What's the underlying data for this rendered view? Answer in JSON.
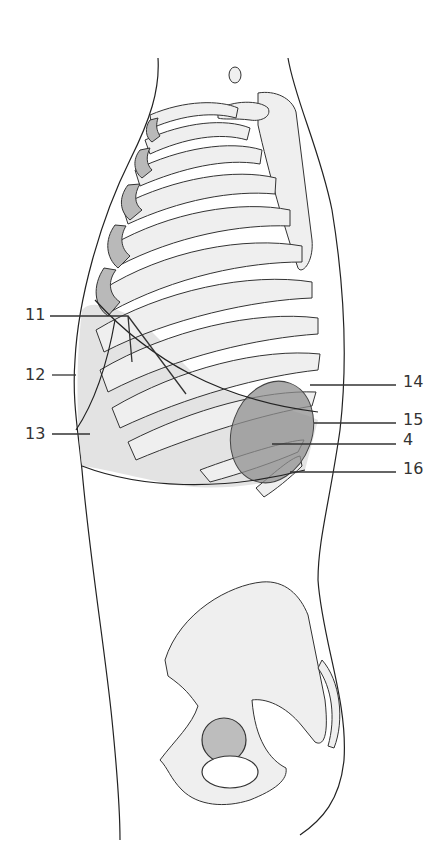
{
  "figure": {
    "labels": {
      "left": [
        {
          "id": "label-11",
          "text": "11",
          "x": 25,
          "y": 307
        },
        {
          "id": "label-12",
          "text": "12",
          "x": 25,
          "y": 367
        },
        {
          "id": "label-13",
          "text": "13",
          "x": 25,
          "y": 426
        }
      ],
      "right": [
        {
          "id": "label-14",
          "text": "14",
          "x": 403,
          "y": 374
        },
        {
          "id": "label-15",
          "text": "15",
          "x": 403,
          "y": 412
        },
        {
          "id": "label-4",
          "text": "4",
          "x": 403,
          "y": 432
        },
        {
          "id": "label-16",
          "text": "16",
          "x": 403,
          "y": 461
        }
      ]
    },
    "colors": {
      "background": "#ffffff",
      "line": "#222222",
      "bone_fill": "#efefef",
      "cartilage_fill": "#b9b9b9",
      "region_fill": "#d9d9d9",
      "organ_fill": "#8f8f8f"
    }
  }
}
